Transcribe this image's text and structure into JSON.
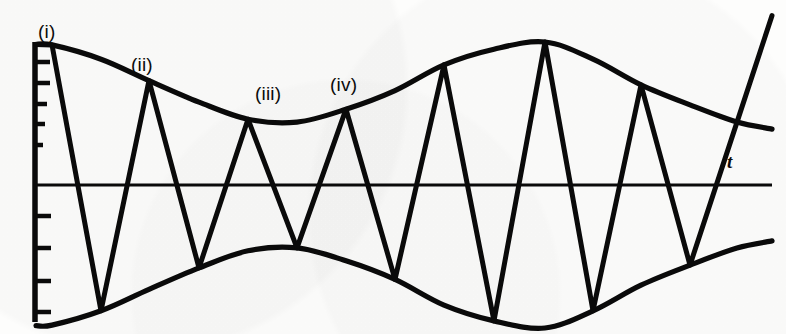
{
  "figure": {
    "caption_labels": [
      {
        "id": "peak-i",
        "text": "(i)",
        "x": 38,
        "y": 22
      },
      {
        "id": "peak-ii",
        "text": "(ii)",
        "x": 131,
        "y": 55
      },
      {
        "id": "peak-iii",
        "text": "(iii)",
        "x": 255,
        "y": 84
      },
      {
        "id": "peak-iv",
        "text": "(iv)",
        "x": 330,
        "y": 75
      }
    ],
    "axis_label": {
      "id": "time-axis-label",
      "text": "t",
      "x": 727,
      "y": 152
    },
    "ink_color": "#0a0a0a",
    "paper_color": "#fdfdfc"
  },
  "chart_data": {
    "type": "line",
    "title": "",
    "subtitle": "",
    "xlabel": "t",
    "ylabel": "",
    "grid": false,
    "legend": null,
    "axes": {
      "x_axis": {
        "type": "time",
        "label": "t",
        "start_px": 34,
        "end_px": 772,
        "baseline_px": 185,
        "ticks_shown": false
      },
      "y_axis": {
        "label": "",
        "top_px": 42,
        "bottom_px": 322,
        "tick_count_upper": 5,
        "tick_count_lower": 4,
        "tick_values_shown": false
      }
    },
    "carrier": {
      "waveform": "triangular",
      "period_px": 98.5,
      "first_peak_px": 52,
      "peak_count": 8
    },
    "envelope": {
      "waveform": "sinusoidal",
      "modulation_period_px": 492,
      "max_amplitude": 1.0,
      "min_amplitude": 0.42,
      "note": "Upper envelope starts near maximum at t=0, falls to a minimum near peak (iii), rises to a second maximum near the sixth peak, then decays toward the right edge."
    },
    "annotated_peaks": [
      {
        "label": "(i)",
        "peak_index": 1,
        "x_px": 52,
        "amplitude": 0.98
      },
      {
        "label": "(ii)",
        "peak_index": 2,
        "x_px": 149,
        "amplitude": 0.73
      },
      {
        "label": "(iii)",
        "peak_index": 3,
        "x_px": 248,
        "amplitude": 0.46
      },
      {
        "label": "(iv)",
        "peak_index": 4,
        "x_px": 346,
        "amplitude": 0.53
      }
    ],
    "peaks": [
      {
        "index": 1,
        "x_px": 52,
        "amplitude": 0.98
      },
      {
        "index": 2,
        "x_px": 149,
        "amplitude": 0.73
      },
      {
        "index": 3,
        "x_px": 248,
        "amplitude": 0.46
      },
      {
        "index": 4,
        "x_px": 346,
        "amplitude": 0.53
      },
      {
        "index": 5,
        "x_px": 444,
        "amplitude": 0.84
      },
      {
        "index": 6,
        "x_px": 545,
        "amplitude": 1.0
      },
      {
        "index": 7,
        "x_px": 641,
        "amplitude": 0.7
      },
      {
        "index": 8,
        "x_px": 737,
        "amplitude": 0.44
      }
    ],
    "troughs": [
      {
        "index": 1,
        "x_px": 101,
        "amplitude": -0.88
      },
      {
        "index": 2,
        "x_px": 199,
        "amplitude": -0.58
      },
      {
        "index": 3,
        "x_px": 297,
        "amplitude": -0.44
      },
      {
        "index": 4,
        "x_px": 395,
        "amplitude": -0.66
      },
      {
        "index": 5,
        "x_px": 494,
        "amplitude": -0.95
      },
      {
        "index": 6,
        "x_px": 593,
        "amplitude": -0.88
      },
      {
        "index": 7,
        "x_px": 690,
        "amplitude": -0.56
      }
    ]
  }
}
